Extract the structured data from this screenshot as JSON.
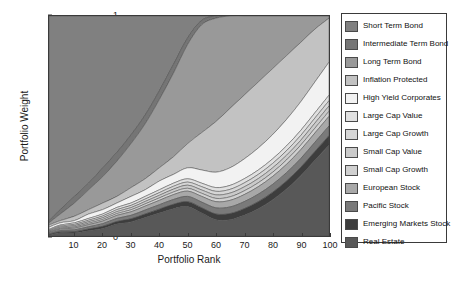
{
  "chart_data": {
    "type": "area",
    "title": "",
    "xlabel": "Portfolio Rank",
    "ylabel": "Portfolio Weight",
    "xlim": [
      1,
      100
    ],
    "ylim": [
      0,
      1
    ],
    "grid": false,
    "legend_position": "right",
    "stacked": true,
    "xticks": [
      10,
      20,
      30,
      40,
      50,
      60,
      70,
      80,
      90,
      100
    ],
    "yticks": [
      0,
      0.1,
      0.2,
      0.3,
      0.4,
      0.5,
      0.6,
      0.7,
      0.8,
      0.9,
      1
    ],
    "x": [
      1,
      5,
      10,
      15,
      20,
      25,
      30,
      35,
      40,
      45,
      50,
      55,
      60,
      65,
      70,
      75,
      80,
      85,
      90,
      95,
      100
    ],
    "series": [
      {
        "name": "Short Term Bond",
        "color": "#808080",
        "values": [
          0.93,
          0.88,
          0.82,
          0.76,
          0.69,
          0.62,
          0.54,
          0.45,
          0.34,
          0.22,
          0.1,
          0.02,
          0.0,
          0.0,
          0.0,
          0.0,
          0.0,
          0.0,
          0.0,
          0.0,
          0.0
        ]
      },
      {
        "name": "Intermediate Term Bond",
        "color": "#757575",
        "values": [
          0.01,
          0.02,
          0.03,
          0.03,
          0.04,
          0.04,
          0.04,
          0.04,
          0.04,
          0.04,
          0.03,
          0.02,
          0.01,
          0.0,
          0.0,
          0.0,
          0.0,
          0.0,
          0.0,
          0.0,
          0.0
        ]
      },
      {
        "name": "Long Term Bond",
        "color": "#999999",
        "values": [
          0.01,
          0.03,
          0.06,
          0.09,
          0.12,
          0.16,
          0.2,
          0.25,
          0.31,
          0.38,
          0.45,
          0.49,
          0.47,
          0.42,
          0.36,
          0.3,
          0.24,
          0.18,
          0.12,
          0.06,
          0.01
        ]
      },
      {
        "name": "Inflation Protected",
        "color": "#c2c2c2",
        "values": [
          0.01,
          0.01,
          0.02,
          0.02,
          0.03,
          0.03,
          0.04,
          0.05,
          0.06,
          0.08,
          0.11,
          0.17,
          0.23,
          0.27,
          0.29,
          0.3,
          0.3,
          0.29,
          0.27,
          0.24,
          0.2
        ]
      },
      {
        "name": "High Yield Corporates",
        "color": "#f2f2f2",
        "values": [
          0.01,
          0.01,
          0.01,
          0.02,
          0.02,
          0.02,
          0.03,
          0.03,
          0.04,
          0.04,
          0.05,
          0.06,
          0.07,
          0.08,
          0.09,
          0.1,
          0.11,
          0.12,
          0.13,
          0.14,
          0.15
        ]
      },
      {
        "name": "Large Cap Value",
        "color": "#e0e0e0",
        "values": [
          0.004,
          0.005,
          0.007,
          0.008,
          0.009,
          0.01,
          0.011,
          0.012,
          0.013,
          0.014,
          0.015,
          0.016,
          0.017,
          0.018,
          0.019,
          0.02,
          0.021,
          0.022,
          0.023,
          0.024,
          0.025
        ]
      },
      {
        "name": "Large Cap Growth",
        "color": "#d6d6d6",
        "values": [
          0.004,
          0.005,
          0.006,
          0.007,
          0.008,
          0.009,
          0.01,
          0.011,
          0.012,
          0.013,
          0.014,
          0.015,
          0.016,
          0.017,
          0.018,
          0.019,
          0.02,
          0.021,
          0.022,
          0.023,
          0.024
        ]
      },
      {
        "name": "Small Cap Value",
        "color": "#cacaca",
        "values": [
          0.004,
          0.005,
          0.006,
          0.007,
          0.008,
          0.009,
          0.01,
          0.011,
          0.012,
          0.013,
          0.014,
          0.015,
          0.016,
          0.017,
          0.018,
          0.019,
          0.02,
          0.021,
          0.022,
          0.023,
          0.024
        ]
      },
      {
        "name": "Small Cap Growth",
        "color": "#d0d0d0",
        "values": [
          0.003,
          0.004,
          0.005,
          0.006,
          0.007,
          0.008,
          0.009,
          0.01,
          0.011,
          0.012,
          0.013,
          0.014,
          0.015,
          0.016,
          0.017,
          0.018,
          0.019,
          0.02,
          0.021,
          0.022,
          0.023
        ]
      },
      {
        "name": "European Stock",
        "color": "#a8a8a8",
        "values": [
          0.004,
          0.006,
          0.008,
          0.01,
          0.012,
          0.014,
          0.016,
          0.018,
          0.02,
          0.022,
          0.024,
          0.026,
          0.028,
          0.03,
          0.032,
          0.034,
          0.036,
          0.038,
          0.04,
          0.042,
          0.044
        ]
      },
      {
        "name": "Pacific Stock",
        "color": "#7a7a7a",
        "values": [
          0.004,
          0.006,
          0.008,
          0.01,
          0.012,
          0.014,
          0.016,
          0.018,
          0.02,
          0.022,
          0.024,
          0.026,
          0.028,
          0.03,
          0.032,
          0.034,
          0.036,
          0.038,
          0.04,
          0.042,
          0.044
        ]
      },
      {
        "name": "Emerging Markets Stock",
        "color": "#3d3d3d",
        "values": [
          0.003,
          0.004,
          0.006,
          0.008,
          0.01,
          0.012,
          0.014,
          0.016,
          0.018,
          0.02,
          0.022,
          0.024,
          0.026,
          0.028,
          0.03,
          0.032,
          0.034,
          0.036,
          0.038,
          0.04,
          0.042
        ]
      },
      {
        "name": "Real Estate",
        "color": "#585858",
        "values": [
          0.012,
          0.02,
          0.033,
          0.048,
          0.064,
          0.082,
          0.101,
          0.122,
          0.144,
          0.168,
          0.213,
          0.294,
          0.381,
          0.454,
          0.515,
          0.568,
          0.613,
          0.654,
          0.694,
          0.733,
          0.771
        ]
      }
    ]
  },
  "axes": {
    "ylabel": "Portfolio Weight",
    "xlabel": "Portfolio Rank",
    "ytick_labels": [
      "0",
      "0.1",
      "0.2",
      "0.3",
      "0.4",
      "0.5",
      "0.6",
      "0.7",
      "0.8",
      "0.9",
      "1"
    ],
    "xtick_labels": [
      "10",
      "20",
      "30",
      "40",
      "50",
      "60",
      "70",
      "80",
      "90",
      "100"
    ]
  },
  "legend": {
    "items": [
      {
        "label": "Short Term Bond",
        "color": "#808080"
      },
      {
        "label": "Intermediate Term Bond",
        "color": "#757575"
      },
      {
        "label": "Long Term Bond",
        "color": "#999999"
      },
      {
        "label": "Inflation Protected",
        "color": "#c2c2c2"
      },
      {
        "label": "High Yield Corporates",
        "color": "#f2f2f2"
      },
      {
        "label": "Large Cap Value",
        "color": "#e0e0e0"
      },
      {
        "label": "Large Cap Growth",
        "color": "#d6d6d6"
      },
      {
        "label": "Small Cap Value",
        "color": "#cacaca"
      },
      {
        "label": "Small Cap Growth",
        "color": "#d0d0d0"
      },
      {
        "label": "European Stock",
        "color": "#a8a8a8"
      },
      {
        "label": "Pacific Stock",
        "color": "#7a7a7a"
      },
      {
        "label": "Emerging Markets Stock",
        "color": "#3d3d3d"
      },
      {
        "label": "Real Estate",
        "color": "#585858"
      }
    ]
  }
}
